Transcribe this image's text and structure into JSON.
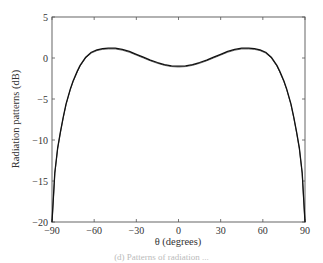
{
  "chart_data": {
    "type": "line",
    "title": "",
    "xlabel": "θ (degrees)",
    "ylabel": "Radiation patterns (dB)",
    "xlim": [
      -90,
      90
    ],
    "ylim": [
      -20,
      5
    ],
    "xticks": [
      -90,
      -60,
      -30,
      0,
      30,
      60,
      90
    ],
    "xtick_labels": [
      "−90",
      "−60",
      "−30",
      "0",
      "30",
      "60",
      "90"
    ],
    "yticks": [
      5,
      0,
      -5,
      -10,
      -15,
      -20
    ],
    "ytick_labels": [
      "5",
      "0",
      "−5",
      "−10",
      "−15",
      "−20"
    ],
    "grid": false,
    "legend": null,
    "series": [
      {
        "name": "pattern",
        "color": "#111111",
        "x": [
          -90,
          -89,
          -88,
          -86,
          -84,
          -82,
          -80,
          -77,
          -75,
          -72,
          -70,
          -66,
          -62,
          -58,
          -54,
          -50,
          -45,
          -40,
          -35,
          -30,
          -25,
          -20,
          -15,
          -10,
          -5,
          0,
          5,
          10,
          15,
          20,
          25,
          30,
          35,
          40,
          45,
          50,
          54,
          58,
          62,
          66,
          70,
          72,
          75,
          77,
          80,
          82,
          84,
          86,
          88,
          89,
          90
        ],
        "y": [
          -20,
          -17,
          -14,
          -11,
          -9,
          -7.2,
          -5.6,
          -3.8,
          -2.8,
          -1.6,
          -0.9,
          0.1,
          0.7,
          1.0,
          1.15,
          1.2,
          1.2,
          1.05,
          0.8,
          0.45,
          0.1,
          -0.25,
          -0.55,
          -0.8,
          -0.95,
          -1.0,
          -0.95,
          -0.8,
          -0.55,
          -0.25,
          0.1,
          0.45,
          0.8,
          1.05,
          1.2,
          1.2,
          1.15,
          1.0,
          0.7,
          0.1,
          -0.9,
          -1.6,
          -2.8,
          -3.8,
          -5.6,
          -7.2,
          -9,
          -11,
          -14,
          -17,
          -20
        ]
      }
    ]
  },
  "caption_fragment": "(d) Patterns of radiation ..."
}
